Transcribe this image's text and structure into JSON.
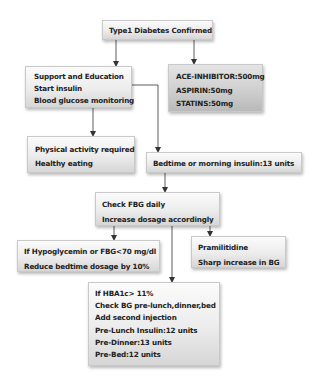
{
  "diagram": {
    "type": "flowchart",
    "nodes": {
      "title": {
        "lines": [
          "Type1 Diabetes Confirmed"
        ]
      },
      "support": {
        "lines": [
          "Support and Education",
          "Start insulin",
          "Blood glucose monitoring"
        ]
      },
      "meds": {
        "lines": [
          "ACE-INHIBITOR:500mg",
          "ASPIRIN:50mg",
          "STATINS:50mg"
        ]
      },
      "lifestyle": {
        "lines": [
          "Physical activity required",
          "Healthy eating"
        ]
      },
      "bedtime": {
        "lines": [
          "Bedtime or morning insulin:13 units"
        ]
      },
      "check_fbg": {
        "lines": [
          "Check FBG daily",
          "Increase dosage accordingly"
        ]
      },
      "hypo": {
        "lines": [
          "If Hypoglycemin or FBG<70 mg/dl",
          "Reduce bedtime dosage by 10%"
        ]
      },
      "pramlintide": {
        "lines": [
          "Pramilitidine",
          "Sharp increase in BG"
        ]
      },
      "hba1c": {
        "lines": [
          "If HBA1c> 11%",
          "Check BG pre-lunch,dinner,bed",
          "Add second injection",
          "Pre-Lunch Insulin:12 units",
          "Pre-Dinner:13 units",
          "Pre-Bed:12 units"
        ]
      }
    },
    "edges": [
      {
        "from": "title",
        "to": "support"
      },
      {
        "from": "title",
        "to": "meds"
      },
      {
        "from": "support",
        "to": "lifestyle"
      },
      {
        "from": "support",
        "to": "bedtime"
      },
      {
        "from": "bedtime",
        "to": "check_fbg"
      },
      {
        "from": "check_fbg",
        "to": "hypo"
      },
      {
        "from": "check_fbg",
        "to": "pramlintide"
      },
      {
        "from": "check_fbg",
        "to": "hba1c"
      }
    ],
    "colors": {
      "line": "#333333",
      "box_border": "#c9c9c9",
      "text": "#222222"
    }
  }
}
